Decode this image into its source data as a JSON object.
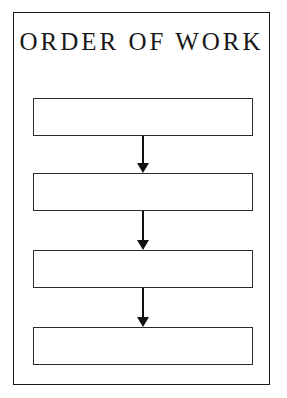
{
  "document": {
    "title": "ORDER OF WORK",
    "background_color": "#ffffff",
    "ink_color": "#1a1a1a",
    "frame": {
      "name": "outer-border",
      "border_color": "#1a1a1a"
    }
  },
  "chart_data": {
    "type": "diagram",
    "subtype": "flowchart",
    "title": "ORDER OF WORK",
    "orientation": "vertical-top-to-bottom",
    "node_count": 4,
    "connector_count": 3,
    "nodes": [
      {
        "id": "step-1",
        "label": "",
        "shape": "rectangle",
        "order": 1
      },
      {
        "id": "step-2",
        "label": "",
        "shape": "rectangle",
        "order": 2
      },
      {
        "id": "step-3",
        "label": "",
        "shape": "rectangle",
        "order": 3
      },
      {
        "id": "step-4",
        "label": "",
        "shape": "rectangle",
        "order": 4
      }
    ],
    "connectors": [
      {
        "from": "step-1",
        "to": "step-2",
        "style": "solid-line-filled-arrowhead",
        "direction": "down",
        "label": ""
      },
      {
        "from": "step-2",
        "to": "step-3",
        "style": "solid-line-filled-arrowhead",
        "direction": "down",
        "label": ""
      },
      {
        "from": "step-3",
        "to": "step-4",
        "style": "solid-line-filled-arrowhead",
        "direction": "down",
        "label": ""
      }
    ],
    "legend": [],
    "annotations": []
  }
}
